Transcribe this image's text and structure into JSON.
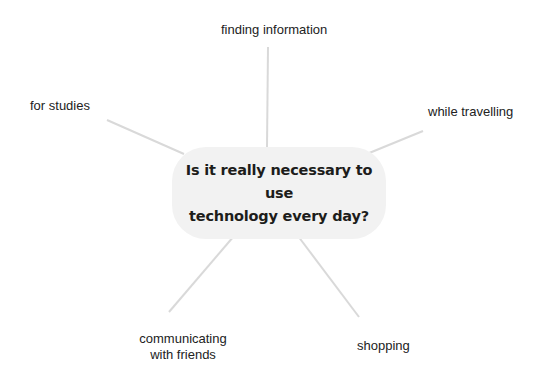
{
  "diagram": {
    "type": "mind-map",
    "center": {
      "line1": "Is it really necessary to use",
      "line2": "technology every day?",
      "fill": "#f2f2f2"
    },
    "branches": [
      {
        "id": "finding-information",
        "label": "finding information"
      },
      {
        "id": "for-studies",
        "label": "for studies"
      },
      {
        "id": "while-travelling",
        "label": "while travelling"
      },
      {
        "id": "communicating",
        "line1": "communicating",
        "line2": "with friends"
      },
      {
        "id": "shopping",
        "label": "shopping"
      }
    ],
    "link_color": "#d9d9d9"
  }
}
